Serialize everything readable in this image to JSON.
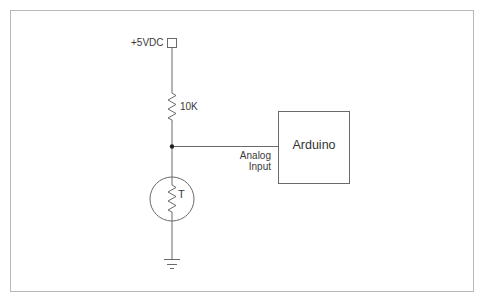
{
  "diagram": {
    "type": "circuit-schematic",
    "power": {
      "label": "+5VDC"
    },
    "resistor": {
      "label": "10K"
    },
    "thermistor": {
      "label": "T"
    },
    "arduino": {
      "label": "Arduino"
    },
    "connection": {
      "label_line1": "Analog",
      "label_line2": "Input"
    },
    "ground": {
      "label": ""
    },
    "colors": {
      "wire": "#6a6a6a",
      "frame": "#b9b9b9",
      "text": "#3a3a3a",
      "background": "#ffffff"
    }
  }
}
